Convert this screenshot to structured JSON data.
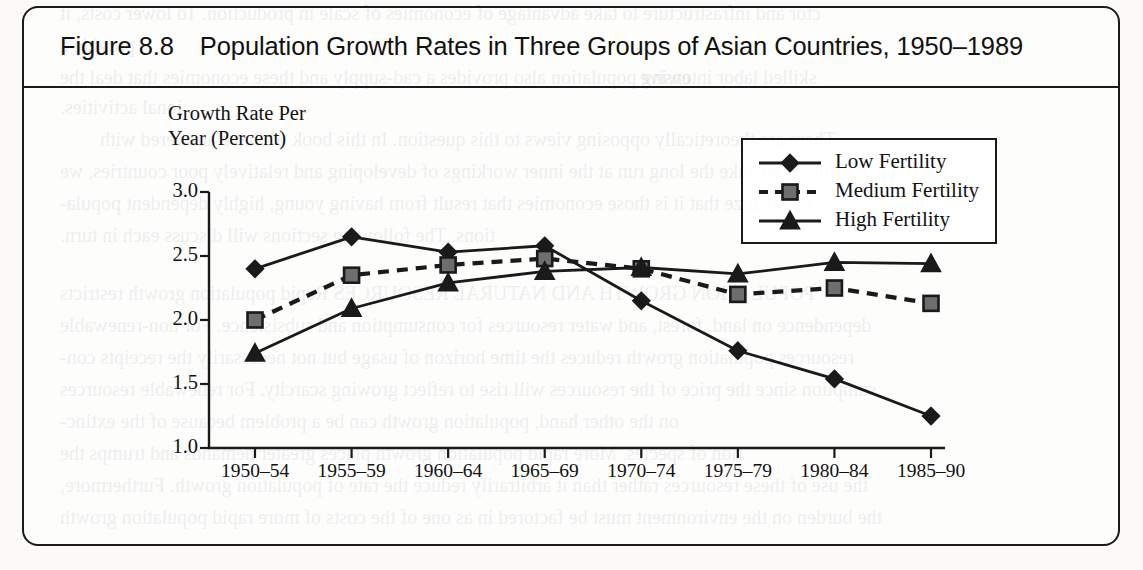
{
  "figure": {
    "number": "Figure 8.8",
    "title": "Population Growth Rates in Three Groups of Asian Countries, 1950–1989"
  },
  "axis": {
    "y_label_line1": "Growth Rate Per",
    "y_label_line2": "Year (Percent)"
  },
  "legend": {
    "items": [
      {
        "label": "Low Fertility",
        "marker": "diamond",
        "dash": "solid"
      },
      {
        "label": "Medium Fertility",
        "marker": "square",
        "dash": "dashed"
      },
      {
        "label": "High Fertility",
        "marker": "triangle",
        "dash": "solid"
      }
    ]
  },
  "bleed_text": [
    {
      "text": "ctor and infrastructure to take advantage of economies of scale in production. To lower costs, it",
      "x": 60,
      "y": 2,
      "size": 20
    },
    {
      "text": "provide a",
      "x": 60,
      "y": 34,
      "size": 20
    },
    {
      "text": "owing population also provides a cad-supply and these economies that deal the",
      "x": 60,
      "y": 66,
      "size": 20
    },
    {
      "text": "skilled labor intensive",
      "x": 640,
      "y": 66,
      "size": 20
    },
    {
      "text": "ional activities.",
      "x": 60,
      "y": 96,
      "size": 20
    },
    {
      "text": "There are theoretically opposing views to this question. In this book we have answered with",
      "x": 100,
      "y": 128,
      "size": 20
    },
    {
      "text": "essistic. If we take the long run at the inner workings of developing and relatively poor countries, we",
      "x": 60,
      "y": 160,
      "size": 20
    },
    {
      "text": "will realize that it is those economies that result from having young, highly dependent popula-",
      "x": 60,
      "y": 192,
      "size": 20
    },
    {
      "text": "tions. The following sections will discuss each in turn.",
      "x": 60,
      "y": 224,
      "size": 20
    },
    {
      "text": "POPULATION GROWTH AND NATURAL RESOURCES    Rapid population growth restricts",
      "x": 60,
      "y": 282,
      "size": 20
    },
    {
      "text": "dependence on land, forest, and water resources for consumption and subsistence. For non-renewable",
      "x": 60,
      "y": 314,
      "size": 20
    },
    {
      "text": "resources population growth reduces the time horizon of usage but not necessarily the receipts con-",
      "x": 60,
      "y": 346,
      "size": 20
    },
    {
      "text": "sumption since the price of the resources will rise to reflect growing scarcity. For renewable resources",
      "x": 60,
      "y": 378,
      "size": 20
    },
    {
      "text": "on the other hand, population growth can be a problem because of the extinc-",
      "x": 60,
      "y": 410,
      "size": 20
    },
    {
      "text": "tion of species. More rapid population growth places greater demands and trumps the",
      "x": 60,
      "y": 442,
      "size": 20
    },
    {
      "text": "the use of these resources rather than it arbitrarily reduce the rate of population growth. Furthermore,",
      "x": 60,
      "y": 474,
      "size": 20
    },
    {
      "text": "the burden on the environment must be factored in as one of the costs of more rapid population growth",
      "x": 60,
      "y": 506,
      "size": 20
    }
  ],
  "chart_data": {
    "type": "line",
    "title": "Population Growth Rates in Three Groups of Asian Countries, 1950–1989",
    "xlabel": "",
    "ylabel": "Growth Rate Per Year (Percent)",
    "ylim": [
      1.0,
      3.0
    ],
    "yticks": [
      3.0,
      2.5,
      2.0,
      1.5,
      1.0
    ],
    "ytick_labels": [
      "3.0",
      "2.5",
      "2.0",
      "1.5",
      "1.0"
    ],
    "grid": false,
    "legend_position": "top-right",
    "categories": [
      "1950–54",
      "1955–59",
      "1960–64",
      "1965–69",
      "1970–74",
      "1975–79",
      "1980–84",
      "1985–90"
    ],
    "series": [
      {
        "name": "Low Fertility",
        "marker": "diamond",
        "dash": "solid",
        "values": [
          2.4,
          2.65,
          2.53,
          2.58,
          2.15,
          1.76,
          1.54,
          1.25
        ]
      },
      {
        "name": "Medium Fertility",
        "marker": "square",
        "dash": "dashed",
        "values": [
          2.0,
          2.35,
          2.43,
          2.48,
          2.4,
          2.2,
          2.25,
          2.13
        ]
      },
      {
        "name": "High Fertility",
        "marker": "triangle",
        "dash": "solid",
        "values": [
          1.74,
          2.09,
          2.29,
          2.38,
          2.41,
          2.36,
          2.45,
          2.44
        ]
      }
    ]
  }
}
